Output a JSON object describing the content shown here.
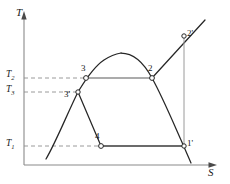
{
  "figure": {
    "type": "temperature-entropy-diagram",
    "title": "",
    "axes": {
      "y_label": "T",
      "x_label": "S",
      "y_axis_name": "temperature-axis",
      "x_axis_name": "entropy-axis"
    },
    "temperature_ticks": [
      {
        "id": "T2",
        "label": "T",
        "sub": "2",
        "y": 77
      },
      {
        "id": "T3",
        "label": "T",
        "sub": "3",
        "y": 92
      },
      {
        "id": "T1",
        "label": "T",
        "sub": "1",
        "y": 145
      }
    ],
    "state_points": [
      {
        "id": "3",
        "label": "3",
        "x": 86,
        "y": 78,
        "marker": true
      },
      {
        "id": "2",
        "label": "2",
        "x": 152,
        "y": 78,
        "marker": true
      },
      {
        "id": "3p",
        "label": "3'",
        "x": 78,
        "y": 92,
        "marker": true
      },
      {
        "id": "2p",
        "label": "2'",
        "x": 184,
        "y": 36,
        "marker": true
      },
      {
        "id": "4",
        "label": "4",
        "x": 101,
        "y": 146,
        "marker": true
      },
      {
        "id": "1p",
        "label": "1'",
        "x": 184,
        "y": 146,
        "marker": true
      }
    ],
    "curves": {
      "vapor_dome": "saturation-dome",
      "liquid_line": "saturated-liquid-line",
      "vapor_line": "saturated-vapor-line",
      "isotherm_2_3": "isothermal-line-T2",
      "isotherm_4_1p": "isothermal-line-T1",
      "expansion_3p_4": "expansion-line",
      "superheat_2_2p": "superheat-line",
      "vertical_2p_1p": "isentropic-line"
    },
    "colors": {
      "line": "#262626",
      "dashed": "#7a7a7a",
      "axis": "#8a8a8a",
      "marker_fill": "#ffffff"
    }
  }
}
